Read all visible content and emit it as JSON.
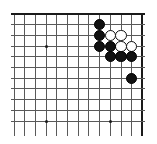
{
  "figure": {
    "board": {
      "cols": 13,
      "rows": 11,
      "origin_x": 14,
      "origin_y": 14,
      "spacing": 10.7,
      "line_color": "#595959",
      "edge_color": "#1a1a1a",
      "background_color": "#ffffff"
    },
    "edges": {
      "top": true,
      "right": true,
      "bottom": false,
      "left": false
    },
    "hoshi_points": [
      {
        "col": 3,
        "row": 3
      },
      {
        "col": 3,
        "row": 10
      },
      {
        "col": 9,
        "row": 10
      }
    ],
    "stones": [
      {
        "color": "black",
        "col": 8,
        "row": 1
      },
      {
        "color": "black",
        "col": 8,
        "row": 2
      },
      {
        "color": "white",
        "col": 9,
        "row": 2
      },
      {
        "color": "white",
        "col": 10,
        "row": 2
      },
      {
        "color": "black",
        "col": 8,
        "row": 3
      },
      {
        "color": "black",
        "col": 9,
        "row": 3
      },
      {
        "color": "white",
        "col": 10,
        "row": 3
      },
      {
        "color": "white",
        "col": 11,
        "row": 3
      },
      {
        "color": "black",
        "col": 9,
        "row": 4
      },
      {
        "color": "black",
        "col": 10,
        "row": 4
      },
      {
        "color": "black",
        "col": 11,
        "row": 4
      },
      {
        "color": "black",
        "col": 11,
        "row": 6
      }
    ],
    "stone_radius": 5.6,
    "colors": {
      "black_stone": "#111111",
      "white_stone": "#ffffff",
      "white_stone_border": "#111111"
    }
  }
}
